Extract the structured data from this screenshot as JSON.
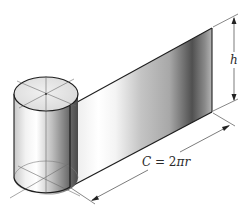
{
  "figure": {
    "labels": {
      "height": "h",
      "circumference_prefix": "C",
      "circumference_equals": " = 2",
      "circumference_pi": "π",
      "circumference_r": "r"
    },
    "colors": {
      "outline": "#1e1e1e",
      "construction_line": "#6a6a6a",
      "surface_light": "#f4f4f4",
      "surface_highlight": "#ffffff",
      "surface_dark": "#4a4a4a",
      "top_face": "#e6e6e6"
    }
  }
}
